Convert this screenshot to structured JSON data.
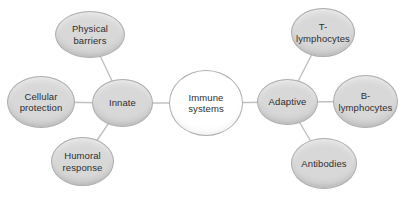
{
  "colors": {
    "node_fill": "#d8d8d8",
    "node_border": "#adadad",
    "center_fill": "#ffffff",
    "line": "#c0c0c0",
    "text": "#2e2e2e"
  },
  "nodes": {
    "immune_systems": {
      "label": "Immune\nsystems"
    },
    "innate": {
      "label": "Innate"
    },
    "adaptive": {
      "label": "Adaptive"
    },
    "physical_barriers": {
      "label": "Physical\nbarriers"
    },
    "cellular_protection": {
      "label": "Cellular\nprotection"
    },
    "humoral_response": {
      "label": "Humoral\nresponse"
    },
    "t_lymphocytes": {
      "label": "T-\nlymphocytes"
    },
    "b_lymphocytes": {
      "label": "B-\nlymphocytes"
    },
    "antibodies": {
      "label": "Antibodies"
    }
  },
  "edges": [
    {
      "from": "physical_barriers",
      "to": "innate"
    },
    {
      "from": "cellular_protection",
      "to": "innate"
    },
    {
      "from": "humoral_response",
      "to": "innate"
    },
    {
      "from": "innate",
      "to": "immune_systems"
    },
    {
      "from": "immune_systems",
      "to": "adaptive"
    },
    {
      "from": "adaptive",
      "to": "t_lymphocytes"
    },
    {
      "from": "adaptive",
      "to": "b_lymphocytes"
    },
    {
      "from": "adaptive",
      "to": "antibodies"
    }
  ]
}
